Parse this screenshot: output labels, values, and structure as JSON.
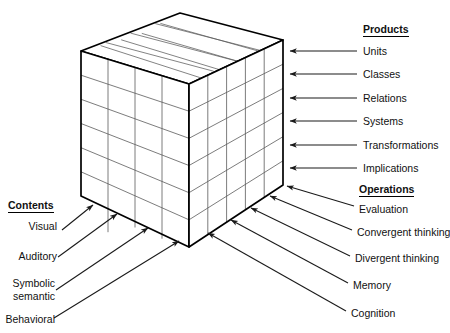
{
  "diagram": {
    "type": "three-dimensional-cube",
    "cube": {
      "rows": 6,
      "cols_front": 5,
      "cols_side": 4,
      "stroke_color": "#000000",
      "grid_color": "#555555",
      "face_color": "#ffffff"
    }
  },
  "products": {
    "heading": "Products",
    "items": [
      {
        "label": "Units"
      },
      {
        "label": "Classes"
      },
      {
        "label": "Relations"
      },
      {
        "label": "Systems"
      },
      {
        "label": "Transformations"
      },
      {
        "label": "Implications"
      }
    ]
  },
  "operations": {
    "heading": "Operations",
    "items": [
      {
        "label": "Evaluation"
      },
      {
        "label": "Convergent thinking"
      },
      {
        "label": "Divergent thinking"
      },
      {
        "label": "Memory"
      },
      {
        "label": "Cognition"
      }
    ]
  },
  "contents": {
    "heading": "Contents",
    "items": [
      {
        "label": "Visual"
      },
      {
        "label": "Auditory"
      },
      {
        "label": "Symbolic"
      },
      {
        "label": "semantic"
      },
      {
        "label": "Behavioral"
      }
    ]
  }
}
